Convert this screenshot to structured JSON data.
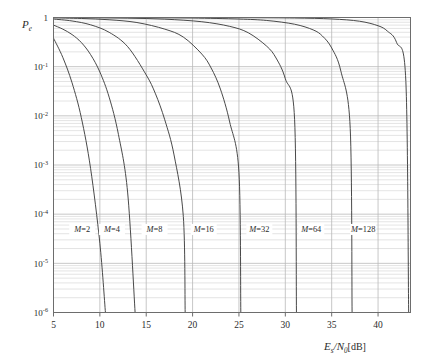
{
  "chart_data": {
    "type": "line",
    "title": "",
    "xlabel": "Es/N0[dB]",
    "ylabel": "Pe",
    "xlim": [
      5,
      43.5
    ],
    "ylim": [
      1e-06,
      1
    ],
    "yscale": "log",
    "grid": "major-and-minor",
    "legend": "inline-curve-labels",
    "xticks": [
      5,
      10,
      15,
      20,
      25,
      30,
      35,
      40
    ],
    "xtick_labels": [
      "5",
      "10",
      "15",
      "20",
      "25",
      "30",
      "35",
      "40"
    ],
    "yticks": [
      1,
      0.1,
      0.01,
      0.001,
      0.0001,
      1e-05,
      1e-06
    ],
    "ytick_labels": [
      "1",
      "10-1",
      "10-2",
      "10-3",
      "10-4",
      "10-5",
      "10-6"
    ],
    "series": [
      {
        "name": "M=2",
        "label": "M=2",
        "label_x": 8.1,
        "label_y": 5e-05,
        "x": [
          5,
          6,
          7,
          8,
          9,
          10,
          10.6
        ],
        "y": [
          0.38,
          0.155,
          0.047,
          0.0092,
          0.00085,
          2.55e-05,
          1e-06
        ]
      },
      {
        "name": "M=4",
        "label": "M=4",
        "label_x": 11.3,
        "label_y": 5e-05,
        "x": [
          5,
          6,
          7,
          8,
          9,
          10,
          11,
          12,
          13,
          13.8
        ],
        "y": [
          0.7,
          0.58,
          0.45,
          0.31,
          0.176,
          0.078,
          0.024,
          0.0042,
          0.00027,
          1e-06
        ]
      },
      {
        "name": "M=8",
        "label": "M=8",
        "label_x": 15.9,
        "label_y": 5e-05,
        "x": [
          5,
          7,
          9,
          11,
          13,
          15,
          16,
          17,
          18,
          19,
          19.2
        ],
        "y": [
          0.93,
          0.85,
          0.71,
          0.5,
          0.255,
          0.068,
          0.028,
          0.0083,
          0.0016,
          9e-05,
          1e-06
        ]
      },
      {
        "name": "M=16",
        "label": "M=16",
        "label_x": 21.2,
        "label_y": 5e-05,
        "x": [
          5,
          8,
          11,
          14,
          17,
          19,
          21,
          22,
          23,
          24,
          25,
          25.2
        ],
        "y": [
          0.985,
          0.955,
          0.9,
          0.79,
          0.58,
          0.4,
          0.18,
          0.094,
          0.035,
          0.0075,
          0.0007,
          1e-06
        ]
      },
      {
        "name": "M=32",
        "label": "M=32",
        "label_x": 27.2,
        "label_y": 5e-05,
        "x": [
          5,
          9,
          13,
          17,
          21,
          24,
          26,
          28,
          29,
          30,
          31,
          31.2
        ],
        "y": [
          0.997,
          0.99,
          0.97,
          0.925,
          0.82,
          0.66,
          0.49,
          0.26,
          0.15,
          0.057,
          0.0085,
          1e-06
        ]
      },
      {
        "name": "M=64",
        "label": "M=64",
        "label_x": 32.8,
        "label_y": 5e-05,
        "x": [
          5,
          10,
          15,
          20,
          25,
          28,
          31,
          33,
          34,
          35,
          36,
          37,
          37.2
        ],
        "y": [
          0.999,
          0.997,
          0.991,
          0.975,
          0.93,
          0.87,
          0.73,
          0.56,
          0.42,
          0.24,
          0.08,
          0.0055,
          1e-06
        ]
      },
      {
        "name": "M=128",
        "label": "M=128",
        "label_x": 38.4,
        "label_y": 5e-05,
        "x": [
          5,
          12,
          19,
          26,
          31,
          35,
          38,
          40,
          41,
          42,
          43,
          43.3
        ],
        "y": [
          0.9998,
          0.9993,
          0.998,
          0.99,
          0.975,
          0.935,
          0.84,
          0.68,
          0.53,
          0.31,
          0.05,
          1e-06
        ]
      }
    ]
  },
  "axis": {
    "y_axis_title": "P",
    "y_axis_title_sub": "e",
    "x_axis_title_main": "E",
    "x_axis_title_sub1": "s",
    "x_axis_title_slash": "/N",
    "x_axis_title_sub2": "0",
    "x_axis_title_unit": "[dB]"
  },
  "colors": {
    "curve": "#3f3f3f",
    "frame": "#6d6d6d",
    "major_grid": "#b9b9b9",
    "minor_grid": "#d8d8d8",
    "text": "#2b2b2b",
    "background": "#ffffff"
  }
}
